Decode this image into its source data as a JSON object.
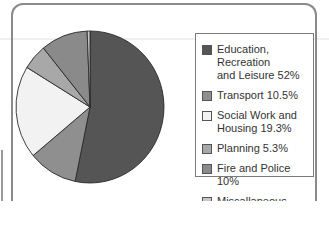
{
  "chart_data": {
    "type": "pie",
    "title": "",
    "categories": [
      "Education, Recreation and Leisure",
      "Transport",
      "Social Work and Housing",
      "Planning",
      "Fire and Police",
      "Miscallaneous"
    ],
    "values": [
      52,
      10.5,
      19.3,
      5.3,
      10,
      0.6
    ],
    "unit": "%",
    "colors": [
      "#555555",
      "#8f8f8f",
      "#f2f2f2",
      "#a8a8a8",
      "#8a8a8a",
      "#c8c8c8"
    ],
    "legend_position": "right",
    "start_angle": "top",
    "direction": "clockwise"
  },
  "legend": {
    "items": [
      {
        "label": "Education, Recreation\nand Leisure 52%",
        "color": "#555555"
      },
      {
        "label": "Transport 10.5%",
        "color": "#8f8f8f"
      },
      {
        "label": "Social Work and\nHousing 19.3%",
        "color": "#f2f2f2"
      },
      {
        "label": "Planning 5.3%",
        "color": "#a8a8a8"
      },
      {
        "label": "Fire and Police 10%",
        "color": "#8a8a8a"
      },
      {
        "label": "Miscallaneous 0.6%",
        "color": "#c8c8c8"
      }
    ]
  }
}
